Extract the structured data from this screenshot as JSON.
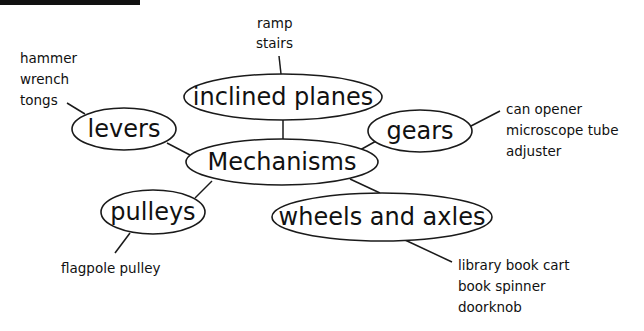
{
  "diagram": {
    "center": {
      "label": "Mechanisms"
    },
    "nodes": [
      {
        "id": "inclined-planes",
        "label": "inclined planes",
        "examples": [
          "ramp",
          "stairs"
        ]
      },
      {
        "id": "levers",
        "label": "levers",
        "examples": [
          "hammer",
          "wrench",
          "tongs"
        ]
      },
      {
        "id": "gears",
        "label": "gears",
        "examples": [
          "can opener",
          "microscope tube",
          "adjuster"
        ]
      },
      {
        "id": "pulleys",
        "label": "pulleys",
        "examples": [
          "flagpole pulley"
        ]
      },
      {
        "id": "wheels-and-axles",
        "label": "wheels and axles",
        "examples": [
          "library book cart",
          "book spinner",
          "doorknob"
        ]
      }
    ]
  },
  "colors": {
    "stroke": "#1a1a1a",
    "text": "#111111",
    "background": "#ffffff"
  }
}
